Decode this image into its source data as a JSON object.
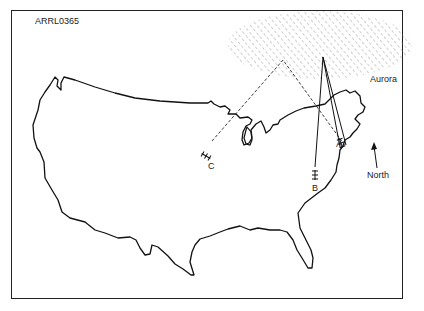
{
  "figure": {
    "id_label": "ARRL0365",
    "aurora_label": "Aurora",
    "north_label": "North",
    "stations": [
      {
        "id": "A",
        "label": "A"
      },
      {
        "id": "B",
        "label": "B"
      },
      {
        "id": "C",
        "label": "C"
      }
    ],
    "colors": {
      "line": "#111111",
      "hatch": "#888888",
      "background": "#ffffff"
    }
  }
}
